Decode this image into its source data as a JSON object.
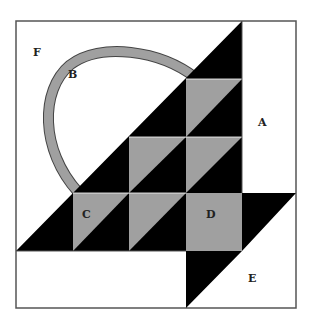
{
  "diagram": {
    "type": "quilt-block",
    "colors": {
      "background": "#ffffff",
      "dark": "#000000",
      "medium": "#a0a0a0",
      "outline": "#555555"
    },
    "labels": {
      "A": "A",
      "B": "B",
      "C": "C",
      "D": "D",
      "E": "E",
      "F": "F"
    },
    "pieces": [
      {
        "label": "A",
        "description": "white rectangle, right side"
      },
      {
        "label": "B",
        "description": "gray curved basket handle"
      },
      {
        "label": "C",
        "description": "half-square triangle unit (gray/black)"
      },
      {
        "label": "D",
        "description": "gray square"
      },
      {
        "label": "E",
        "description": "white bottom-right triangle/rectangle piece"
      },
      {
        "label": "F",
        "description": "white background upper-left"
      }
    ]
  }
}
